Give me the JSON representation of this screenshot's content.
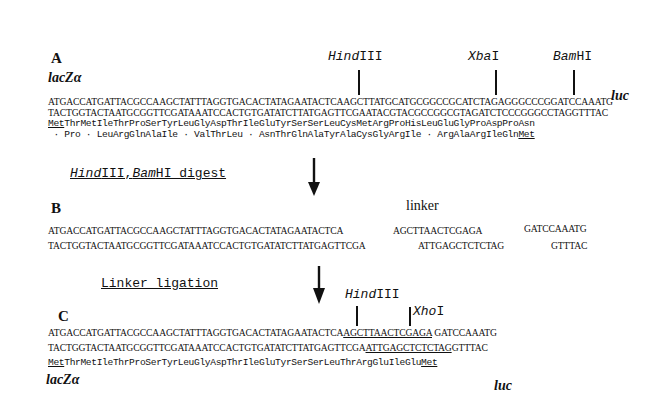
{
  "panel_a": {
    "label": "A",
    "left_gene": "lacZα",
    "right_gene": "luc",
    "sites": [
      {
        "italic": "Hind",
        "roman": "III"
      },
      {
        "italic": "Xba",
        "roman": "I"
      },
      {
        "italic": "Bam",
        "roman": "HI"
      }
    ],
    "top_strand": "ATGACCATGATTACGCCAAGCTATTTAGGTGACACTATAGAATACTCAAGCTTATGCATGCGGCCGCATCTAGAGGGCCCGGATCCAAATG",
    "bottom_strand": "TACTGGTACTAATGCGGTTCGATAAATCCACTGTGATATCTTATGAGTTCGAATACGTACGCCGGCGTAGATCTCCCGGGCCTAGGTTTAC",
    "frame1_start": "Met",
    "frame1_rest": "ThrMetIleThrProSerTyrLeuGlyAspThrIleGluTyrSerSerLeuCysMetArgProHisLeuGluGlyProAspProAsn",
    "frame2_rest": " · Pro · LeuArgGlnAlaIle · ValThrLeu · AsnThrGlnAlaTyrAlaCysGlyArgIle · ArgAlaArgIleGln",
    "frame2_end": "Met"
  },
  "step1": {
    "italic1": "Hind",
    "roman1": "III,",
    "italic2": "Bam",
    "roman2": "HI digest"
  },
  "panel_b": {
    "label": "B",
    "linker_label": "linker",
    "left_top": "ATGACCATGATTACGCCAAGCTATTTAGGTGACACTATAGAATACTCA",
    "left_bottom": "TACTGGTACTAATGCGGTTCGATAAATCCACTGTGATATCTTATGAGTTCGA",
    "linker_top": "AGCTTAACTCGAGA",
    "linker_bottom": "ATTGAGCTCTCTAG",
    "right_top": "GATCCAAATG",
    "right_bottom": "GTTTAC"
  },
  "step2": {
    "label": "Linker ligation"
  },
  "panel_c": {
    "label": "C",
    "sites": [
      {
        "italic": "Hind",
        "roman": "III"
      },
      {
        "italic": "Xho",
        "roman": "I"
      }
    ],
    "top_left": "ATGACCATGATTACGCCAAGCTATTTAGGTGACACTATAGAATACTCA",
    "top_linker": "AGCTTAACTCGAGA",
    "top_right": " GATCCAAATG",
    "bottom_left": "TACTGGTACTAATGCGGTTCGATAAATCCACTGTGATATCTTATGAGTTCGA",
    "bottom_linker": "ATTGAGCTCTCTAG",
    "bottom_right": "GTTTAC",
    "frame_start": "Met",
    "frame_rest": "ThrMetIleThrProSerTyrLeuGlyAspThrIleGluTyrSerSerLeuThrArgGluIleGlu",
    "frame_end": "Met",
    "left_gene": "lacZα",
    "right_gene": "luc"
  }
}
